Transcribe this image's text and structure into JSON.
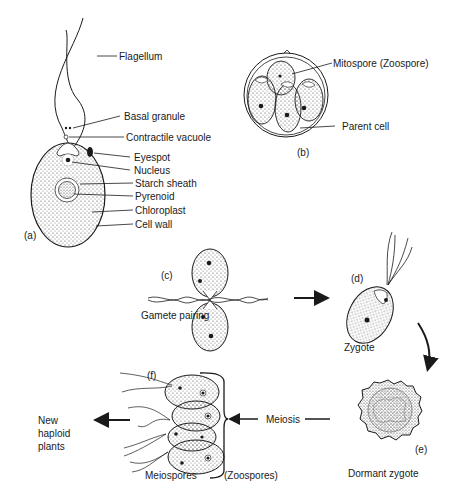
{
  "panels": {
    "a": {
      "tag": "(a)",
      "labels": [
        "Flagellum",
        "Basal granule",
        "Contractile vacuole",
        "Eyespot",
        "Nucleus",
        "Starch sheath",
        "Pyrenoid",
        "Chloroplast",
        "Cell wall"
      ]
    },
    "b": {
      "tag": "(b)",
      "labels": [
        "Mitospore (Zoospore)",
        "Parent cell"
      ]
    },
    "c": {
      "tag": "(c)",
      "caption": "Gamete pairing"
    },
    "d": {
      "tag": "(d)",
      "caption": "Zygote"
    },
    "e": {
      "tag": "(e)",
      "caption": "Dormant zygote"
    },
    "f": {
      "tag": "(f)",
      "caption": "Meiospores",
      "bracket_label": "(Zoospores)"
    }
  },
  "process": {
    "meiosis": "Meiosis"
  },
  "result": {
    "line1": "New",
    "line2": "haploid",
    "line3": "plants"
  },
  "colors": {
    "ink": "#1a1a1a",
    "stipple": "#8a8a8a",
    "background": "#ffffff"
  }
}
